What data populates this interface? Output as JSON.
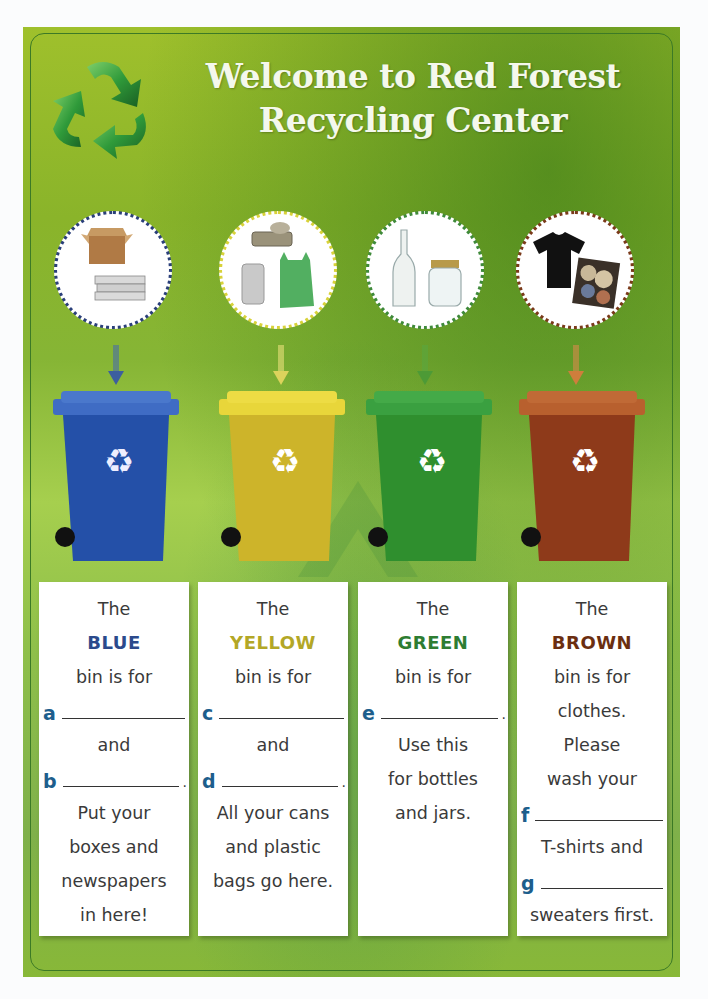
{
  "header": {
    "title_line1": "Welcome to Red Forest",
    "title_line2": "Recycling Center",
    "logo_icon": "recycle-icon"
  },
  "colors": {
    "background_green": "#8ab42a",
    "blue": "#2b4a8c",
    "yellow": "#b3a726",
    "green": "#2e7d32",
    "brown": "#6b2e10",
    "letter": "#1d5e8c"
  },
  "bins": [
    {
      "color_name": "BLUE",
      "color_hex": "#2b4a8c",
      "bin_hex": "#2450a8",
      "items": [
        "cardboard-box",
        "newspapers"
      ],
      "card": {
        "the": "The",
        "color": "BLUE",
        "bin_is_for": "bin is for",
        "blank1_letter": "a",
        "and": "and",
        "blank2_letter": "b",
        "text": [
          "Put your",
          "boxes and",
          "newspapers",
          "in here!"
        ]
      }
    },
    {
      "color_name": "YELLOW",
      "color_hex": "#b3a726",
      "bin_hex": "#d8c02c",
      "items": [
        "sardine-can",
        "soda-can",
        "plastic-bag"
      ],
      "card": {
        "the": "The",
        "color": "YELLOW",
        "bin_is_for": "bin is for",
        "blank1_letter": "c",
        "and": "and",
        "blank2_letter": "d",
        "text": [
          "All your cans",
          "and plastic",
          "bags go here."
        ]
      }
    },
    {
      "color_name": "GREEN",
      "color_hex": "#2e7d32",
      "bin_hex": "#2f8f2e",
      "items": [
        "glass-bottle",
        "glass-jar"
      ],
      "card": {
        "the": "The",
        "color": "GREEN",
        "bin_is_for": "bin is for",
        "blank1_letter": "e",
        "text": [
          "Use this",
          "for bottles",
          "and jars."
        ]
      }
    },
    {
      "color_name": "BROWN",
      "color_hex": "#6b2e10",
      "bin_hex": "#8e3a1a",
      "items": [
        "t-shirt",
        "sweaters"
      ],
      "card": {
        "the": "The",
        "color": "BROWN",
        "bin_is_for": "bin is for",
        "text_a": [
          "clothes.",
          "Please",
          "wash your"
        ],
        "blank1_letter": "f",
        "text_b": "T-shirts and",
        "blank2_letter": "g",
        "text_c": "sweaters first."
      }
    }
  ]
}
